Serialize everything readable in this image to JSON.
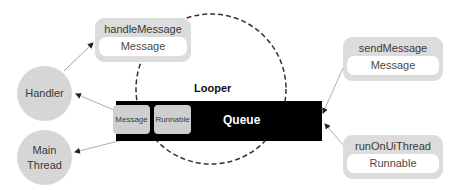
{
  "diagram": {
    "looper": {
      "label": "Looper",
      "shape": "dashed-circle"
    },
    "queue": {
      "label": "Queue",
      "items": [
        {
          "label": "Message"
        },
        {
          "label": "Runnable"
        }
      ]
    },
    "left_nodes": {
      "handler": {
        "label": "Handler"
      },
      "main_thread": {
        "line1": "Main",
        "line2": "Thread"
      }
    },
    "methods": {
      "handle_message": {
        "title": "handleMessage",
        "arg": "Message"
      },
      "send_message": {
        "title": "sendMessage",
        "arg": "Message"
      },
      "run_on_ui_thread": {
        "title": "runOnUiThread",
        "arg": "Runnable"
      }
    },
    "edges": [
      {
        "from": "sendMessage",
        "to": "Queue"
      },
      {
        "from": "runOnUiThread",
        "to": "Queue"
      },
      {
        "from": "Queue.Message",
        "to": "Handler"
      },
      {
        "from": "Queue.Runnable",
        "to": "Main Thread"
      },
      {
        "from": "Handler",
        "to": "handleMessage"
      }
    ],
    "colors": {
      "node_fill": "#d6d6d6",
      "box_fill": "#dcdcdc",
      "queue_fill": "#000000",
      "chip_fill": "#cfcfcf",
      "edge": "#9a9a9a",
      "dash": "#333333"
    }
  }
}
